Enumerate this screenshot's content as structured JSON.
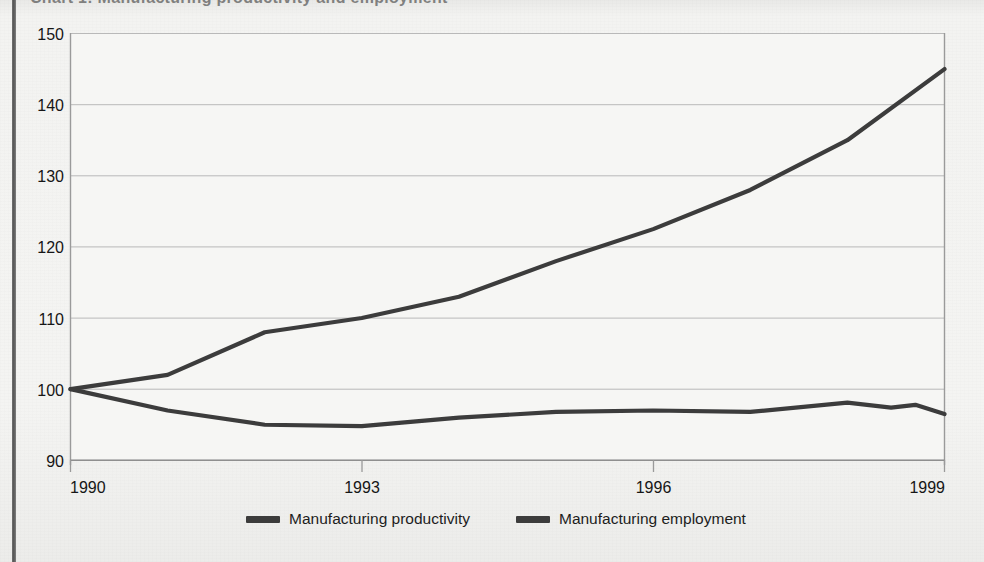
{
  "page": {
    "title_fragment": "Chart 1: Manufacturing productivity and employment",
    "background_color": "#f3f3f1"
  },
  "chart_data": {
    "type": "line",
    "title": "",
    "xlabel": "",
    "ylabel": "",
    "x": [
      1990,
      1991,
      1992,
      1993,
      1994,
      1995,
      1996,
      1997,
      1998,
      1999
    ],
    "xtick_labels": [
      "1990",
      "1993",
      "1996",
      "1999"
    ],
    "xticks": [
      1990,
      1993,
      1996,
      1999
    ],
    "xlim": [
      1990,
      1999
    ],
    "ytick_labels": [
      "90",
      "100",
      "110",
      "120",
      "130",
      "140",
      "150"
    ],
    "yticks": [
      90,
      100,
      110,
      120,
      130,
      140,
      150
    ],
    "ylim": [
      90,
      150
    ],
    "grid": true,
    "grid_axis": "y",
    "legend_position": "bottom-center",
    "series": [
      {
        "name": "Manufacturing productivity",
        "color": "#3c3c3c",
        "values": [
          100,
          102,
          108,
          110,
          113,
          118,
          122.5,
          128,
          135,
          145
        ]
      },
      {
        "name": "Manufacturing employment",
        "color": "#3c3c3c",
        "values": [
          100,
          97,
          95,
          94.8,
          96,
          96.8,
          97,
          96.8,
          98,
          96.5
        ],
        "detail_x": [
          1990,
          1991,
          1992,
          1993,
          1994,
          1995,
          1996,
          1997,
          1998,
          1998.45,
          1998.7,
          1999
        ],
        "detail_values": [
          100,
          97,
          95,
          94.8,
          96,
          96.8,
          97,
          96.8,
          98.1,
          97.4,
          97.8,
          96.5
        ]
      }
    ]
  },
  "legend": {
    "items": [
      {
        "label": "Manufacturing productivity",
        "color": "#3c3c3c"
      },
      {
        "label": "Manufacturing employment",
        "color": "#3c3c3c"
      }
    ]
  },
  "axis": {
    "y_labels": [
      "150",
      "140",
      "130",
      "120",
      "110",
      "100",
      "90"
    ],
    "x_labels": [
      "1990",
      "1993",
      "1996",
      "1999"
    ]
  }
}
